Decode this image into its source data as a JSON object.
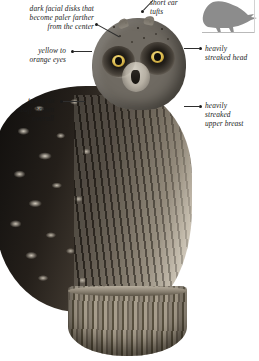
{
  "plate": {
    "subject": "short-eared-owl",
    "description": "Photographic field-guide plate of a perched owl with annotated callouts",
    "colors": {
      "text": "#1a1a1a",
      "leader_line": "#2e2e2e",
      "silhouette_fill": "#8c8c8c",
      "background": "#ffffff"
    }
  },
  "callouts": [
    {
      "id": "facial-disks",
      "text": "dark facial disks that\nbecome paler farther\nfrom the center",
      "align": "right"
    },
    {
      "id": "short-ear-tufts",
      "text": "short ear\ntufts",
      "align": "left"
    },
    {
      "id": "eyes",
      "text": "yellow to\norange eyes",
      "align": "right"
    },
    {
      "id": "streaked-head",
      "text": "heavily\nstreaked head",
      "align": "left"
    },
    {
      "id": "overall-color",
      "text": "tawny to\nbuff-brown\noverall",
      "align": "right"
    },
    {
      "id": "streaked-breast",
      "text": "heavily\nstreaked\nupper breast",
      "align": "left"
    }
  ],
  "silhouette": {
    "name": "owl-silhouette",
    "facing": "right"
  }
}
